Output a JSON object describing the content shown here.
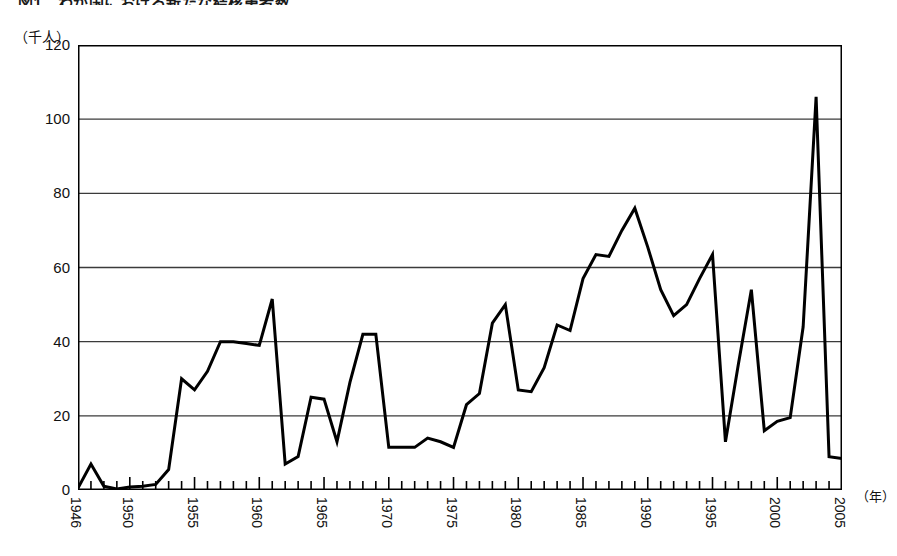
{
  "figure": {
    "title": "図1　わが国における新たな結核患者数",
    "y_unit_label": "（千人）",
    "x_unit_label": "（年）"
  },
  "axis": {
    "y_ticks": [
      "0",
      "20",
      "40",
      "60",
      "80",
      "100",
      "120"
    ],
    "x_ticks": [
      "1946",
      "1950",
      "1955",
      "1960",
      "1965",
      "1970",
      "1975",
      "1980",
      "1985",
      "1990",
      "1995",
      "2000",
      "2005"
    ]
  },
  "style": {
    "line_color": "#000000",
    "grid_color": "#3b3b3b",
    "frame_color": "#000000",
    "background": "#ffffff"
  },
  "chart_data": {
    "type": "line",
    "title": "図1　わが国における新たな結核患者数",
    "xlabel": "（年）",
    "ylabel": "（千人）",
    "xlim": [
      1946,
      2005
    ],
    "ylim": [
      0,
      120
    ],
    "grid": true,
    "legend": "none",
    "series": [
      {
        "name": "新たな結核患者数（千人）",
        "x": [
          1946,
          1947,
          1948,
          1949,
          1950,
          1951,
          1952,
          1953,
          1954,
          1955,
          1956,
          1957,
          1958,
          1959,
          1960,
          1961,
          1962,
          1963,
          1964,
          1965,
          1966,
          1967,
          1968,
          1969,
          1970,
          1971,
          1972,
          1973,
          1974,
          1975,
          1976,
          1977,
          1978,
          1979,
          1980,
          1981,
          1982,
          1983,
          1984,
          1985,
          1986,
          1987,
          1988,
          1989,
          1990,
          1991,
          1992,
          1993,
          1994,
          1995,
          1996,
          1997,
          1998,
          1999,
          2000,
          2001,
          2002,
          2003,
          2004,
          2005
        ],
        "values": [
          0.5,
          7.0,
          1.0,
          0.3,
          0.8,
          1.0,
          1.5,
          5.5,
          30.0,
          27.0,
          32.0,
          40.0,
          40.0,
          39.5,
          39.0,
          51.5,
          7.0,
          9.0,
          25.0,
          24.5,
          13.0,
          29.0,
          42.0,
          42.0,
          11.5,
          11.5,
          11.5,
          14.0,
          13.0,
          11.5,
          23.0,
          26.0,
          45.0,
          50.0,
          27.0,
          26.5,
          33.0,
          44.5,
          43.0,
          57.0,
          63.5,
          63.0,
          70.0,
          76.0,
          65.5,
          54.0,
          47.0,
          50.0,
          57.0,
          63.5,
          13.0,
          34.0,
          54.0,
          16.0,
          18.5,
          19.5,
          44.0,
          106.0,
          9.0,
          8.5
        ],
        "note_values_are_read_from_plot": true
      }
    ]
  }
}
